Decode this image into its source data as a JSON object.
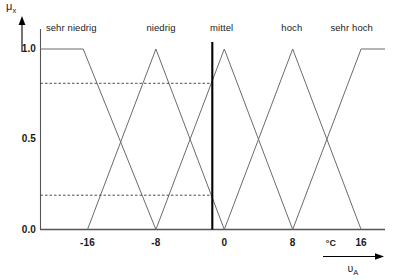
{
  "chart_data": {
    "type": "line",
    "title": "",
    "xlabel": "υA",
    "xunit": "°C",
    "ylabel": "μx",
    "xlim": [
      -21.5,
      18.8
    ],
    "ylim": [
      0.0,
      1.0
    ],
    "grid": false,
    "legend_position": "top-inside",
    "xticks": [
      -16,
      -8,
      0,
      8,
      16
    ],
    "xtick_labels": [
      "-16",
      "-8",
      "0",
      "8",
      "16"
    ],
    "yticks": [
      0.0,
      0.5,
      1.0
    ],
    "ytick_labels": [
      "0.0",
      "0.5",
      "1.0"
    ],
    "series": [
      {
        "name": "sehr niedrig",
        "label_x": -17.9,
        "points": [
          [
            -21.5,
            1.0
          ],
          [
            -16.5,
            1.0
          ],
          [
            -8,
            0.0
          ]
        ]
      },
      {
        "name": "niedrig",
        "label_x": -7.4,
        "points": [
          [
            -16,
            0.0
          ],
          [
            -8,
            1.0
          ],
          [
            0,
            0.0
          ]
        ]
      },
      {
        "name": "mittel",
        "label_x": -0.3,
        "points": [
          [
            -8,
            0.0
          ],
          [
            0,
            1.0
          ],
          [
            8,
            0.0
          ]
        ]
      },
      {
        "name": "hoch",
        "label_x": 7.9,
        "points": [
          [
            0,
            0.0
          ],
          [
            8,
            1.0
          ],
          [
            16,
            0.0
          ]
        ]
      },
      {
        "name": "sehr hoch",
        "label_x": 14.9,
        "points": [
          [
            8,
            0.0
          ],
          [
            16,
            1.0
          ],
          [
            18.8,
            1.0
          ]
        ]
      }
    ],
    "marker_line": {
      "name": "input-value-line",
      "x": -1.4,
      "y_from": 0.0,
      "y_to": 1.0
    },
    "dashed_levels": [
      {
        "name": "mu-upper",
        "y": 0.81,
        "x_from": -21.5,
        "x_to": -1.4
      },
      {
        "name": "mu-lower",
        "y": 0.19,
        "x_from": -21.5,
        "x_to": -1.4
      }
    ]
  },
  "axis": {
    "y_title": "μ",
    "y_title_sub": "x",
    "x_title": "υ",
    "x_title_sub": "A",
    "x_unit": "°C"
  }
}
